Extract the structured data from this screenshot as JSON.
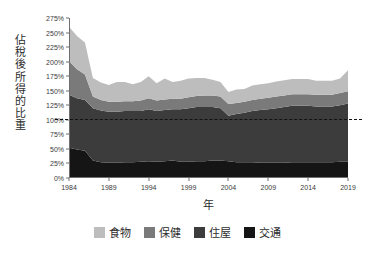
{
  "top_sliver": {
    "text": "― ― ― ― ― ― ― ― ― ― ―"
  },
  "axes": {
    "y_title": "佔稅後所得的比重",
    "y_title_chars": [
      "佔",
      "稅",
      "後",
      "所",
      "得",
      "的",
      "比",
      "重"
    ],
    "x_title": "年"
  },
  "colors": {
    "food": "#bdbdbd",
    "health": "#7a7a7a",
    "housing": "#3c3c3c",
    "transport": "#151515",
    "axis": "#6f6f6f",
    "text": "#2b2b2b",
    "reference_line": "#111111",
    "background": "#ffffff"
  },
  "chart_data": {
    "type": "area",
    "stacked": true,
    "title": "",
    "subtitle": "",
    "xlabel": "年",
    "ylabel": "佔稅後所得的比重",
    "xlim": [
      1984,
      2019
    ],
    "ylim": [
      0,
      275
    ],
    "grid": false,
    "legend_position": "bottom",
    "y_tick_labels": [
      "0%",
      "25%",
      "50%",
      "75%",
      "100%",
      "125%",
      "150%",
      "175%",
      "200%",
      "225%",
      "250%",
      "275%"
    ],
    "y_tick_values": [
      0,
      25,
      50,
      75,
      100,
      125,
      150,
      175,
      200,
      225,
      250,
      275
    ],
    "x_tick_labels": [
      "1984",
      "1989",
      "1994",
      "1999",
      "2004",
      "2009",
      "2014",
      "2019"
    ],
    "x_tick_values": [
      1984,
      1989,
      1994,
      1999,
      2004,
      2009,
      2014,
      2019
    ],
    "annotations": [
      {
        "type": "hline",
        "value": 100,
        "label": "100%",
        "style": "dashed"
      }
    ],
    "x": [
      1984,
      1985,
      1986,
      1987,
      1988,
      1989,
      1990,
      1991,
      1992,
      1993,
      1994,
      1995,
      1996,
      1997,
      1998,
      1999,
      2000,
      2001,
      2002,
      2003,
      2004,
      2005,
      2006,
      2007,
      2008,
      2009,
      2010,
      2011,
      2012,
      2013,
      2014,
      2015,
      2016,
      2017,
      2018,
      2019
    ],
    "series": [
      {
        "name": "交通",
        "key": "transport",
        "color": "#151515",
        "order": 1,
        "values": [
          52,
          49,
          47,
          30,
          27,
          26,
          26,
          27,
          27,
          28,
          29,
          28,
          29,
          30,
          28,
          28,
          29,
          29,
          30,
          30,
          29,
          27,
          27,
          27,
          26,
          26,
          26,
          26,
          27,
          27,
          27,
          27,
          27,
          27,
          28,
          28
        ]
      },
      {
        "name": "住屋",
        "key": "housing",
        "color": "#3c3c3c",
        "order": 2,
        "values": [
          91,
          88,
          87,
          90,
          89,
          88,
          88,
          88,
          88,
          87,
          89,
          87,
          88,
          88,
          90,
          92,
          93,
          93,
          92,
          90,
          78,
          83,
          85,
          88,
          91,
          92,
          94,
          96,
          97,
          97,
          97,
          96,
          96,
          96,
          97,
          100
        ]
      },
      {
        "name": "保健",
        "key": "health",
        "color": "#7a7a7a",
        "order": 3,
        "values": [
          58,
          50,
          44,
          20,
          18,
          17,
          17,
          17,
          17,
          18,
          19,
          18,
          18,
          18,
          18,
          19,
          19,
          20,
          20,
          20,
          20,
          19,
          19,
          19,
          19,
          20,
          20,
          20,
          20,
          20,
          20,
          20,
          20,
          20,
          21,
          21
        ]
      },
      {
        "name": "食物",
        "key": "food",
        "color": "#bdbdbd",
        "order": 4,
        "values": [
          59,
          57,
          55,
          32,
          30,
          29,
          34,
          33,
          29,
          32,
          38,
          30,
          36,
          29,
          31,
          32,
          31,
          30,
          27,
          25,
          21,
          23,
          22,
          25,
          25,
          25,
          26,
          26,
          26,
          26,
          26,
          24,
          24,
          24,
          25,
          36
        ]
      }
    ],
    "legend": [
      {
        "label": "食物",
        "color": "#bdbdbd"
      },
      {
        "label": "保健",
        "color": "#7a7a7a"
      },
      {
        "label": "住屋",
        "color": "#3c3c3c"
      },
      {
        "label": "交通",
        "color": "#151515"
      }
    ]
  }
}
